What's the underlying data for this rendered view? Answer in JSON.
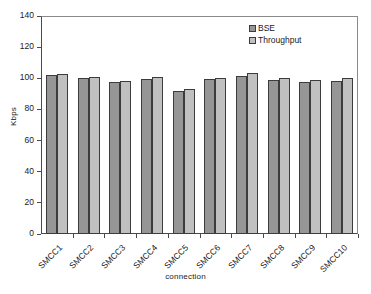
{
  "chart_data": {
    "type": "bar",
    "title": "",
    "xlabel": "connection",
    "ylabel": "Kbps",
    "ylim": [
      0,
      140
    ],
    "yticks": [
      0,
      20,
      40,
      60,
      80,
      100,
      120,
      140
    ],
    "ytick_labels": [
      "0",
      "20",
      "40",
      "60",
      "80",
      "100",
      "120",
      "140"
    ],
    "grid": false,
    "legend_position": "top-right-inside",
    "categories": [
      "SMCC1",
      "SMCC2",
      "SMCC3",
      "SMCC4",
      "SMCC5",
      "SMCC6",
      "SMCC7",
      "SMCC8",
      "SMCC9",
      "SMCC10"
    ],
    "series": [
      {
        "name": "BSE",
        "color": "#969696",
        "values": [
          101.8,
          100.2,
          97.8,
          99.6,
          91.8,
          99.4,
          101.4,
          98.8,
          97.9,
          98.4
        ]
      },
      {
        "name": "Throughput",
        "color": "#c0c0c0",
        "values": [
          102.5,
          100.8,
          98.4,
          100.9,
          92.9,
          100.0,
          103.4,
          99.9,
          99.2,
          100.3
        ]
      }
    ]
  },
  "legend": {
    "entries": [
      {
        "label": "BSE",
        "swatch": "bse-swatch-icon"
      },
      {
        "label": "Throughput",
        "swatch": "throughput-swatch-icon"
      }
    ]
  }
}
